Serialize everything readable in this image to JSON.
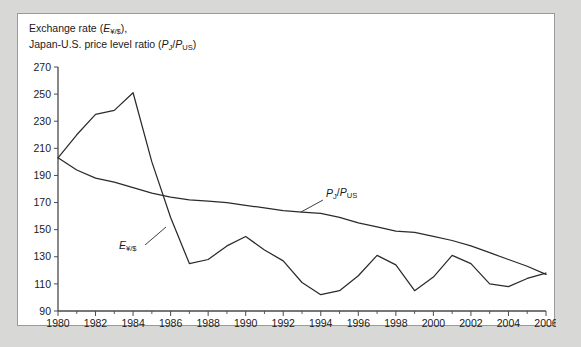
{
  "figure": {
    "caption_line1_prefix": "Exchange rate (",
    "caption_line1_symbol": "E",
    "caption_line1_subscript": "¥/$",
    "caption_line1_suffix": "),",
    "caption_line2_prefix": "Japan-U.S. price level ratio (",
    "caption_line2_symbol1": "P",
    "caption_line2_subscript1": "J",
    "caption_line2_divider": "/",
    "caption_line2_symbol2": "P",
    "caption_line2_subscript2": "US",
    "caption_line2_suffix": ")",
    "background_color": "#d8d8d6",
    "panel_color": "#ffffff",
    "line_color": "#2b2b2b",
    "axis_color": "#4a4a4a"
  },
  "annotations": {
    "exchange_rate_label_symbol": "E",
    "exchange_rate_label_subscript": "¥/$",
    "price_ratio_label_symbol1": "P",
    "price_ratio_label_subscript1": "J",
    "price_ratio_label_divider": "/",
    "price_ratio_label_symbol2": "P",
    "price_ratio_label_subscript2": "US"
  },
  "chart_data": {
    "type": "line",
    "title": "Exchange rate (E¥/$), Japan-U.S. price level ratio (PJ/PUS)",
    "xlabel": "",
    "ylabel": "",
    "xlim": [
      1980,
      2006
    ],
    "ylim": [
      90,
      270
    ],
    "ytick_values": [
      90,
      110,
      130,
      150,
      170,
      190,
      210,
      230,
      250,
      270
    ],
    "ytick_labels": [
      "90",
      "110",
      "130",
      "150",
      "170",
      "190",
      "210",
      "230",
      "250",
      "270"
    ],
    "xtick_values": [
      1980,
      1982,
      1984,
      1986,
      1988,
      1990,
      1992,
      1994,
      1996,
      1998,
      2000,
      2002,
      2004,
      2006
    ],
    "xtick_labels": [
      "1980",
      "1982",
      "1984",
      "1986",
      "1988",
      "1990",
      "1992",
      "1994",
      "1996",
      "1998",
      "2000",
      "2002",
      "2004",
      "2006"
    ],
    "xtick_minor_step": 1,
    "grid": false,
    "legend": "inline-annotations",
    "x": [
      1980,
      1981,
      1982,
      1983,
      1984,
      1985,
      1986,
      1987,
      1988,
      1989,
      1990,
      1991,
      1992,
      1993,
      1994,
      1995,
      1996,
      1997,
      1998,
      1999,
      2000,
      2001,
      2002,
      2003,
      2004,
      2005,
      2006
    ],
    "series": [
      {
        "name": "E¥/$",
        "values": [
          203,
          220,
          235,
          238,
          251,
          200,
          159,
          125,
          128,
          138,
          145,
          135,
          127,
          111,
          102,
          105,
          116,
          131,
          124,
          105,
          115,
          131,
          125,
          110,
          108,
          114,
          118
        ]
      },
      {
        "name": "PJ/PUS",
        "values": [
          203,
          194,
          188,
          185,
          181,
          177,
          174,
          172,
          171,
          170,
          168,
          166,
          164,
          163,
          162,
          159,
          155,
          152,
          149,
          148,
          145,
          142,
          138,
          133,
          128,
          123,
          117
        ]
      }
    ]
  }
}
